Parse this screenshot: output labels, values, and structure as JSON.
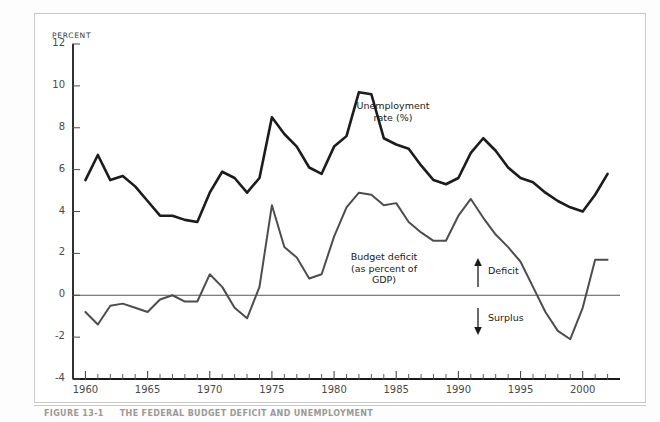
{
  "figure": {
    "caption_lead": "FIGURE 13-1",
    "caption_title": "THE FEDERAL BUDGET DEFICIT AND UNEMPLOYMENT"
  },
  "chart_data": {
    "type": "line",
    "title": "",
    "xlabel": "",
    "ylabel": "PERCENT",
    "ylim": [
      -4,
      12
    ],
    "xlim": [
      1959,
      2003
    ],
    "grid": false,
    "legend_position": "inline-annotations",
    "yticks": [
      12,
      10,
      8,
      6,
      4,
      2,
      0,
      -2,
      -4
    ],
    "ytick_labels": [
      "12",
      "10",
      "8",
      "6",
      "4",
      "2",
      "0",
      "-2",
      "-4"
    ],
    "xticks": [
      1960,
      1965,
      1970,
      1975,
      1980,
      1985,
      1990,
      1995,
      2000
    ],
    "xtick_labels": [
      "1960",
      "1965",
      "1970",
      "1975",
      "1980",
      "1985",
      "1990",
      "1995",
      "2000"
    ],
    "x": [
      1960,
      1961,
      1962,
      1963,
      1964,
      1965,
      1966,
      1967,
      1968,
      1969,
      1970,
      1971,
      1972,
      1973,
      1974,
      1975,
      1976,
      1977,
      1978,
      1979,
      1980,
      1981,
      1982,
      1983,
      1984,
      1985,
      1986,
      1987,
      1988,
      1989,
      1990,
      1991,
      1992,
      1993,
      1994,
      1995,
      1996,
      1997,
      1998,
      1999,
      2000,
      2001,
      2002
    ],
    "series": [
      {
        "name": "Unemployment rate (%)",
        "color": "#1c1c1c",
        "width": 2.6,
        "annotation": "Unemployment\nrate (%)",
        "values": [
          5.5,
          6.7,
          5.5,
          5.7,
          5.2,
          4.5,
          3.8,
          3.8,
          3.6,
          3.5,
          4.9,
          5.9,
          5.6,
          4.9,
          5.6,
          8.5,
          7.7,
          7.1,
          6.1,
          5.8,
          7.1,
          7.6,
          9.7,
          9.6,
          7.5,
          7.2,
          7.0,
          6.2,
          5.5,
          5.3,
          5.6,
          6.8,
          7.5,
          6.9,
          6.1,
          5.6,
          5.4,
          4.9,
          4.5,
          4.2,
          4.0,
          4.8,
          5.8
        ]
      },
      {
        "name": "Budget deficit (as percent of GDP)",
        "color": "#4d4d4d",
        "width": 2.0,
        "annotation": "Budget deficit\n(as percent of\nGDP)",
        "values": [
          -0.8,
          -1.4,
          -0.5,
          -0.4,
          -0.6,
          -0.8,
          -0.2,
          0.0,
          -0.3,
          -0.3,
          1.0,
          0.4,
          -0.6,
          -1.1,
          0.4,
          4.3,
          2.3,
          1.8,
          0.8,
          1.0,
          2.8,
          4.2,
          4.9,
          4.8,
          4.3,
          4.4,
          3.5,
          3.0,
          2.6,
          2.6,
          3.8,
          4.6,
          3.7,
          2.9,
          2.3,
          1.6,
          0.4,
          -0.8,
          -1.7,
          -2.1,
          -0.6,
          1.7,
          1.7
        ]
      }
    ],
    "annotations": [
      {
        "text": "Unemployment rate (%)",
        "kind": "series-label",
        "x": 1984.5,
        "y": 9.0
      },
      {
        "text": "Budget deficit (as percent of GDP)",
        "kind": "series-label",
        "x": 1983.0,
        "y": 2.0
      },
      {
        "text": "Deficit",
        "kind": "direction-up",
        "x": 1996.0,
        "y": 1.5
      },
      {
        "text": "Surplus",
        "kind": "direction-down",
        "x": 1996.0,
        "y": -1.4
      }
    ],
    "zero_line": 0
  },
  "labels": {
    "unemployment_line1": "Unemployment",
    "unemployment_line2": "rate (%)",
    "deficit_line1": "Budget deficit",
    "deficit_line2": "(as percent of",
    "deficit_line3": "GDP)",
    "deficit_arrow": "Deficit",
    "surplus_arrow": "Surplus"
  }
}
